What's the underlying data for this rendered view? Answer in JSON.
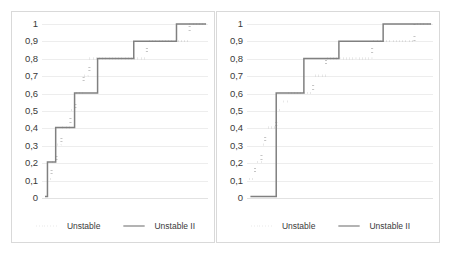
{
  "chart_data": [
    {
      "type": "line",
      "title": "",
      "xlabel": "",
      "ylabel": "",
      "ylim": [
        0,
        1
      ],
      "xlim": [
        0,
        10
      ],
      "grid": true,
      "legend_position": "bottom-center",
      "yticks": [
        "1",
        "0,9",
        "0,8",
        "0,7",
        "0,6",
        "0,5",
        "0,4",
        "0,3",
        "0,2",
        "0,1",
        "0"
      ],
      "ytick_values": [
        1,
        0.9,
        0.8,
        0.7,
        0.6,
        0.5,
        0.4,
        0.3,
        0.2,
        0.1,
        0
      ],
      "series": [
        {
          "name": "Unstable",
          "style": "dotted",
          "color": "#1a1a1a",
          "x": [
            0.35,
            0.45,
            0.6,
            0.75,
            0.9,
            1.05,
            1.2,
            1.45,
            1.75,
            2.05,
            2.3,
            2.55,
            2.9,
            3.3,
            3.6,
            3.9,
            4.6,
            5.6,
            6.4,
            6.9,
            7.4,
            8.4,
            9.0,
            10
          ],
          "values": [
            0.1,
            0.1,
            0.2,
            0.2,
            0.3,
            0.3,
            0.4,
            0.4,
            0.5,
            0.6,
            0.6,
            0.7,
            0.8,
            0.8,
            0.8,
            0.8,
            0.8,
            0.8,
            0.9,
            0.9,
            0.9,
            0.9,
            1.0,
            1.0
          ]
        },
        {
          "name": "Unstable II",
          "style": "solid",
          "color": "#808080",
          "x": [
            0.2,
            0.35,
            0.5,
            0.85,
            1.3,
            2.0,
            2.6,
            3.4,
            4.4,
            5.6,
            6.5,
            7.2,
            8.2,
            10
          ],
          "values": [
            0.0,
            0.2,
            0.2,
            0.4,
            0.4,
            0.6,
            0.6,
            0.8,
            0.8,
            0.9,
            0.9,
            0.9,
            1.0,
            1.0
          ]
        }
      ]
    },
    {
      "type": "line",
      "title": "",
      "xlabel": "",
      "ylabel": "",
      "ylim": [
        0,
        1
      ],
      "xlim": [
        0,
        10
      ],
      "grid": true,
      "legend_position": "bottom-center",
      "yticks": [
        "1",
        "0,9",
        "0,8",
        "0,7",
        "0,6",
        "0,5",
        "0,4",
        "0,3",
        "0,2",
        "0,1",
        "0"
      ],
      "ytick_values": [
        1,
        0.9,
        0.8,
        0.7,
        0.6,
        0.5,
        0.4,
        0.3,
        0.2,
        0.1,
        0
      ],
      "series": [
        {
          "name": "Unstable",
          "style": "dotted",
          "color": "#1a1a1a",
          "x": [
            0.15,
            0.3,
            0.45,
            0.6,
            0.8,
            1.0,
            1.3,
            1.6,
            1.9,
            2.2,
            2.5,
            3.0,
            3.6,
            4.3,
            5.0,
            5.6,
            6.2,
            6.8,
            7.6,
            8.3,
            9.1,
            10
          ],
          "values": [
            0.1,
            0.1,
            0.2,
            0.2,
            0.3,
            0.4,
            0.4,
            0.5,
            0.55,
            0.6,
            0.6,
            0.6,
            0.7,
            0.8,
            0.8,
            0.8,
            0.8,
            0.9,
            0.9,
            0.9,
            1.0,
            1.0
          ]
        },
        {
          "name": "Unstable II",
          "style": "solid",
          "color": "#808080",
          "x": [
            0.2,
            0.9,
            1.6,
            2.4,
            3.1,
            3.9,
            5.0,
            6.2,
            7.4,
            10
          ],
          "values": [
            0.0,
            0.0,
            0.6,
            0.6,
            0.8,
            0.8,
            0.9,
            0.9,
            1.0,
            1.0
          ]
        }
      ]
    }
  ],
  "panels": [
    {
      "id": "left",
      "legend": {
        "items": [
          {
            "label": "Unstable",
            "style": "dotted",
            "color": "#1a1a1a"
          },
          {
            "label": "Unstable II",
            "style": "solid",
            "color": "#808080"
          }
        ]
      }
    },
    {
      "id": "right",
      "legend": {
        "items": [
          {
            "label": "Unstable",
            "style": "dotted",
            "color": "#1a1a1a"
          },
          {
            "label": "Unstable II",
            "style": "solid",
            "color": "#808080"
          }
        ]
      }
    }
  ]
}
